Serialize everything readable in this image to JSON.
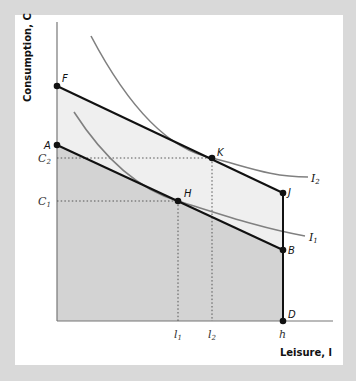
{
  "figure": {
    "axes": {
      "y_label": "Consumption, C",
      "x_label": "Leisure, l"
    },
    "points": {
      "F": "F",
      "A": "A",
      "K": "K",
      "H": "H",
      "J": "J",
      "B": "B",
      "D": "D"
    },
    "y_ticks": [
      {
        "base": "C",
        "sub": "2"
      },
      {
        "base": "C",
        "sub": "1"
      }
    ],
    "x_ticks": [
      {
        "base": "l",
        "sub": "1"
      },
      {
        "base": "l",
        "sub": "2"
      },
      {
        "base": "h",
        "sub": ""
      }
    ],
    "curves": [
      {
        "base": "I",
        "sub": "2"
      },
      {
        "base": "I",
        "sub": "1"
      }
    ],
    "colors": {
      "background": "#d9d9d9",
      "panel": "#ffffff",
      "inner_region": "#d3d3d3",
      "outer_region": "#efefef",
      "budget_line": "#111111",
      "indifference_curve": "#808080",
      "axis": "#777777"
    }
  }
}
